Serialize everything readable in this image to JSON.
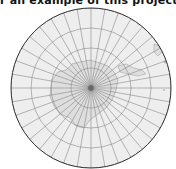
{
  "caption": "r an example of this projection)",
  "map": {
    "projection": "azimuthal",
    "center": [
      91,
      88
    ],
    "radius": 80,
    "ocean_color": "#eeeeee",
    "land_color": "#dcdcdc",
    "grid_color": "#888888",
    "border_color": "#333333",
    "parallel_radii": [
      20,
      40,
      60,
      80
    ],
    "meridian_count": 36
  }
}
